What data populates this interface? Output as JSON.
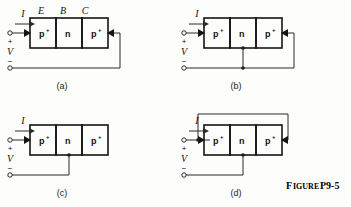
{
  "figure": {
    "caption_large": "F",
    "caption": "FIGURE P9-5",
    "caption_word": "IGURE",
    "caption_number": "P9-5"
  },
  "device": {
    "region_left": "p",
    "region_left_sup": "+",
    "region_mid": "n",
    "region_right": "p",
    "region_right_sup": "+",
    "terminal_E": "E",
    "terminal_B": "B",
    "terminal_C": "C"
  },
  "common": {
    "current_label": "I",
    "voltage_label": "V",
    "plus_sign": "+",
    "minus_sign": "−"
  },
  "panels": [
    {
      "id": "a",
      "caption": "(a)",
      "current_label": "I",
      "voltage_label": "V",
      "plus_sign": "+",
      "minus_sign": "−",
      "region_left": "p",
      "region_left_sup": "+",
      "region_mid": "n",
      "region_right": "p",
      "region_right_sup": "+",
      "show_top_terminal_labels": true,
      "terminal_E": "E",
      "terminal_B": "B",
      "terminal_C": "C",
      "description": "emitter driven, collector returned to source, base floating"
    },
    {
      "id": "b",
      "caption": "(b)",
      "current_label": "I",
      "voltage_label": "V",
      "plus_sign": "+",
      "minus_sign": "−",
      "region_left": "p",
      "region_left_sup": "+",
      "region_mid": "n",
      "region_right": "p",
      "region_right_sup": "+",
      "show_top_terminal_labels": false,
      "description": "emitter driven, base and collector both returned to source"
    },
    {
      "id": "c",
      "caption": "(c)",
      "current_label": "I",
      "voltage_label": "V",
      "plus_sign": "+",
      "minus_sign": "−",
      "region_left": "p",
      "region_left_sup": "+",
      "region_mid": "n",
      "region_right": "p",
      "region_right_sup": "+",
      "show_top_terminal_labels": false,
      "description": "emitter driven, base returned to source, collector floating"
    },
    {
      "id": "d",
      "caption": "(d)",
      "current_label": "I",
      "voltage_label": "V",
      "plus_sign": "+",
      "minus_sign": "−",
      "region_left": "p",
      "region_left_sup": "+",
      "region_mid": "n",
      "region_right": "p",
      "region_right_sup": "+",
      "show_top_terminal_labels": false,
      "description": "emitter tied to collector over the top, base returned to source"
    }
  ],
  "colors": {
    "background": "#fdfdfc",
    "block_fill_outer": "#c9c9c9",
    "block_fill_inner": "#dcdcdc",
    "wire": "#2b2b2b",
    "outline": "#141414",
    "text": "#111111"
  }
}
